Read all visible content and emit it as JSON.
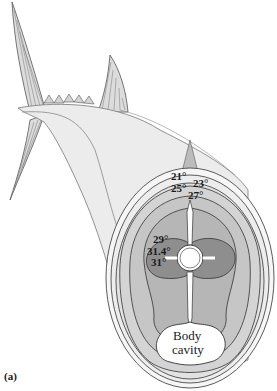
{
  "figure": {
    "panel_label": "(a)",
    "temperatures": {
      "t21": "21°",
      "t23": "23°",
      "t25": "25°",
      "t27": "27°",
      "t29": "29°",
      "t31_4": "31.4°",
      "t31": "31°"
    },
    "body_cavity_label_line1": "Body",
    "body_cavity_label_line2": "cavity",
    "colors": {
      "outer_skin": "#f4f4f4",
      "band_1": "#e6e6e6",
      "band_2": "#d6d6d6",
      "band_3": "#c4c4c4",
      "band_4": "#b4b4b4",
      "red_muscle": "#8e8e8e",
      "fin": "#d8d8d8",
      "outline": "#444444"
    }
  }
}
